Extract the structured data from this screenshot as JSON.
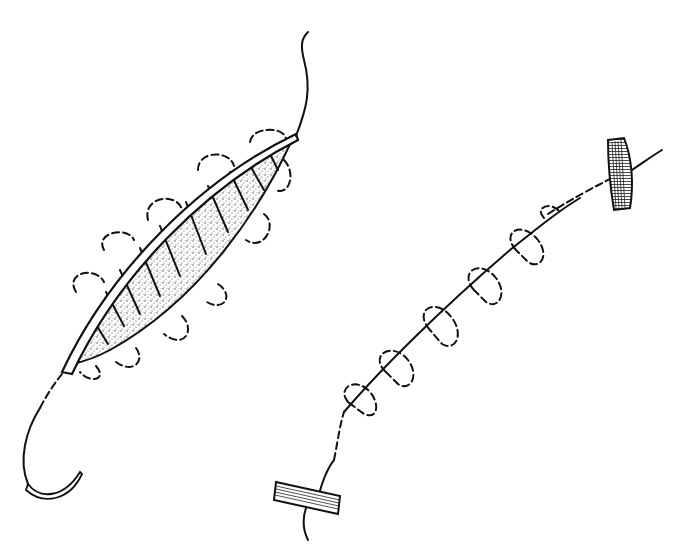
{
  "figure": {
    "background": "#ffffff",
    "ink_color": "#111111",
    "stipple_color": "#9a9a9a",
    "panels": [
      {
        "id": "left",
        "elements": [
          "wound-edge-strip",
          "stippled-wound",
          "tissue-bands",
          "dashed-loops",
          "suture-tail-top",
          "curved-needle"
        ],
        "loop_count": 9
      },
      {
        "id": "right",
        "elements": [
          "bolster-top",
          "bolster-bottom",
          "continuous-suture-line",
          "dashed-loops"
        ],
        "loop_count": 5
      }
    ]
  }
}
